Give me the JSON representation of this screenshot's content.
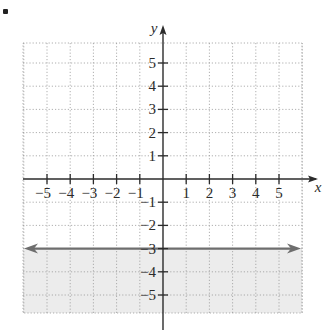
{
  "chart_data": {
    "type": "line",
    "title": "",
    "xlabel": "x",
    "ylabel": "y",
    "xlim": [
      -6,
      6
    ],
    "ylim": [
      -6,
      6
    ],
    "grid": true,
    "grid_style": "dotted",
    "x_ticks": [
      -5,
      -4,
      -3,
      -2,
      -1,
      1,
      2,
      3,
      4,
      5
    ],
    "y_ticks": [
      5,
      4,
      3,
      2,
      1,
      -1,
      -2,
      -3,
      -4,
      -5
    ],
    "x_tick_labels": [
      "−5",
      "−4",
      "−3",
      "−2",
      "−1",
      "1",
      "2",
      "3",
      "4",
      "5"
    ],
    "y_tick_labels": [
      "5",
      "4",
      "3",
      "2",
      "1",
      "−1",
      "−2",
      "−3",
      "−4",
      "−5"
    ],
    "series": [
      {
        "name": "boundary line y = -3",
        "x": [
          -6,
          6
        ],
        "y": [
          -3,
          -3
        ],
        "style": "solid",
        "arrows": "both",
        "color": "#6e6e6e"
      }
    ],
    "shaded_region": {
      "description": "y <= -3",
      "y_max": -3,
      "y_min": -6,
      "color": "#ececec"
    },
    "legend": null
  },
  "colors": {
    "axis": "#2b2b2b",
    "grid": "#9a9a9a",
    "line": "#6e6e6e",
    "shade": "#ececec",
    "text": "#2b2b2b"
  },
  "decor": {
    "bullet": "•"
  }
}
